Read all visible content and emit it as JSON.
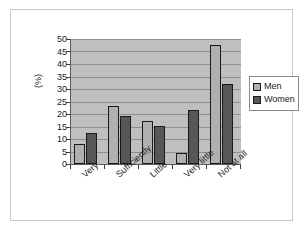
{
  "chart_data": {
    "type": "bar",
    "title": "",
    "subtitle": "",
    "xlabel": "",
    "ylabel": "(%)",
    "ylim": [
      0,
      50
    ],
    "ytick_step": 5,
    "yticks": [
      "50",
      "45",
      "40",
      "35",
      "30",
      "25",
      "20",
      "15",
      "10",
      "5",
      "0"
    ],
    "grid": true,
    "legend_position": "right",
    "categories": [
      "Very",
      "Sufficiently",
      "Little",
      "Very little",
      "Not at all"
    ],
    "series": [
      {
        "name": "Men",
        "color": "#b0b0b0",
        "values": [
          8,
          23,
          17,
          4.5,
          47.5
        ]
      },
      {
        "name": "Women",
        "color": "#575757",
        "values": [
          12.5,
          19,
          15,
          21.5,
          32
        ]
      }
    ]
  },
  "legend": {
    "items": [
      {
        "label": "Men",
        "swatch": "men"
      },
      {
        "label": "Women",
        "swatch": "women"
      }
    ]
  },
  "colors": {
    "men": "#b0b0b0",
    "women": "#575757",
    "plot_background": "#bfbfbf",
    "gridline": "#8f8f8f",
    "axis": "#5a5a5a",
    "text": "#1a1a1a",
    "figure_background": "#ffffff",
    "frame": "#c8c8c8"
  }
}
